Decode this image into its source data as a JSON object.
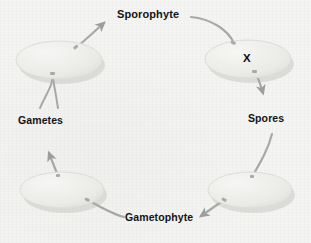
{
  "diagram": {
    "background_color": "#f4f4f2",
    "stage_fill": "#ececea",
    "stage_stroke": "#d8d8d4",
    "connector_color": "#a8a8a6",
    "text_color": "#141414",
    "labels": {
      "sporophyte": "Sporophyte",
      "x": "X",
      "spores": "Spores",
      "gametophyte": "Gametophyte",
      "gametes": "Gametes"
    },
    "stages": [
      {
        "id": "top-left",
        "name": "zygote-stage-disc",
        "cx": 59,
        "cy": 60,
        "rx": 43,
        "ry": 19
      },
      {
        "id": "top-right",
        "name": "sporophyte-stage-disc",
        "cx": 248,
        "cy": 59,
        "rx": 43,
        "ry": 19
      },
      {
        "id": "bottom-right",
        "name": "spore-stage-disc",
        "cx": 250,
        "cy": 190,
        "rx": 42,
        "ry": 18
      },
      {
        "id": "bottom-left",
        "name": "gametophyte-stage-disc",
        "cx": 62,
        "cy": 190,
        "rx": 42,
        "ry": 18
      }
    ],
    "connectors": [
      {
        "name": "arrow-zygote-to-sporophyte",
        "from": "top-left disc",
        "to": "Sporophyte label",
        "arrowhead": true
      },
      {
        "name": "line-sporophyte-to-x",
        "from": "Sporophyte label",
        "to": "top-right disc",
        "arrowhead": false
      },
      {
        "name": "arrow-x-to-spores",
        "from": "top-right disc",
        "to": "Spores label",
        "arrowhead": true
      },
      {
        "name": "line-spores-to-germination",
        "from": "Spores label",
        "to": "bottom-right disc",
        "arrowhead": false
      },
      {
        "name": "arrow-to-gametophyte",
        "from": "bottom-right disc",
        "to": "Gametophyte label",
        "arrowhead": true
      },
      {
        "name": "line-gametophyte-to-disc",
        "from": "Gametophyte label",
        "to": "bottom-left disc",
        "arrowhead": false
      },
      {
        "name": "arrow-to-gametes",
        "from": "bottom-left disc",
        "to": "Gametes label",
        "arrowhead": true
      },
      {
        "name": "fork-gametes-to-zygote",
        "from": "Gametes label",
        "to": "top-left disc",
        "arrowhead": false
      }
    ]
  }
}
